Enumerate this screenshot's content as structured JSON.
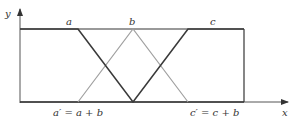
{
  "diagram": {
    "axes": {
      "x_label": "x",
      "y_label": "y"
    },
    "top_labels": {
      "a": "a",
      "b": "b",
      "c": "c"
    },
    "bottom_labels": {
      "a_prime": "a′ = a + b",
      "c_prime": "c′ = c + b"
    },
    "colors": {
      "dark_line": "#3a3a3a",
      "gray_line": "#a0a0a0",
      "axis": "#555555"
    },
    "shapes": {
      "dark_trapezoid_inverted": "Top edge from y-axis to a, down to bottom at b, up to c, continues along top to right edge",
      "gray_triangle": "From a' on bottom up to peak at b on top, down to c' on bottom"
    }
  }
}
